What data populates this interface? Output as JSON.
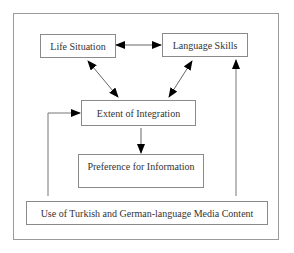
{
  "diagram": {
    "nodes": [
      {
        "id": "life",
        "label": "Life Situation"
      },
      {
        "id": "lang",
        "label": "Language Skills"
      },
      {
        "id": "integ",
        "label": "Extent of Integration"
      },
      {
        "id": "pref",
        "label": "Preference for Information"
      },
      {
        "id": "media",
        "label": "Use of Turkish and German-language Media Content"
      }
    ],
    "edges": [
      {
        "from": "life",
        "to": "lang",
        "type": "bidirectional"
      },
      {
        "from": "life",
        "to": "integ",
        "type": "bidirectional"
      },
      {
        "from": "lang",
        "to": "integ",
        "type": "bidirectional"
      },
      {
        "from": "integ",
        "to": "pref",
        "type": "directed"
      },
      {
        "from": "media",
        "to": "integ",
        "type": "directed"
      },
      {
        "from": "media",
        "to": "lang",
        "type": "directed"
      }
    ],
    "colors": {
      "line": "#7a7a7a",
      "arrowhead": "#000000",
      "border": "#8a8a8a"
    }
  }
}
